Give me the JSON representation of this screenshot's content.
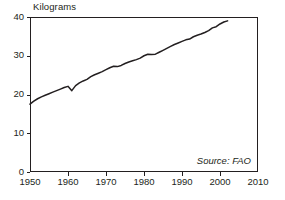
{
  "chart_data": {
    "type": "line",
    "title": "",
    "ylabel": "Kilograms",
    "xlabel": "",
    "xlim": [
      1950,
      2010
    ],
    "ylim": [
      0,
      40
    ],
    "grid": false,
    "legend": null,
    "annotations": [
      {
        "name": "source",
        "text": "Source: FAO",
        "position": "bottom-right-inside",
        "style": "italic"
      }
    ],
    "yticks": [
      0,
      10,
      20,
      30,
      40
    ],
    "ytick_labels": [
      "0",
      "10",
      "20",
      "30",
      "40"
    ],
    "xticks": [
      1950,
      1960,
      1970,
      1980,
      1990,
      2000,
      2010
    ],
    "xtick_labels": [
      "1950",
      "1960",
      "1970",
      "1980",
      "1990",
      "2000",
      "2010"
    ],
    "series": [
      {
        "name": "Kilograms per person",
        "color": "#231f20",
        "x": [
          1950,
          1951,
          1952,
          1953,
          1954,
          1955,
          1956,
          1957,
          1958,
          1959,
          1960,
          1961,
          1962,
          1963,
          1964,
          1965,
          1966,
          1967,
          1968,
          1969,
          1970,
          1971,
          1972,
          1973,
          1974,
          1975,
          1976,
          1977,
          1978,
          1979,
          1980,
          1981,
          1982,
          1983,
          1984,
          1985,
          1986,
          1987,
          1988,
          1989,
          1990,
          1991,
          1992,
          1993,
          1994,
          1995,
          1996,
          1997,
          1998,
          1999,
          2000,
          2001,
          2002
        ],
        "values": [
          17.5,
          18.3,
          18.9,
          19.4,
          19.8,
          20.2,
          20.6,
          21.0,
          21.4,
          21.8,
          22.1,
          21.0,
          22.3,
          23.0,
          23.5,
          23.9,
          24.6,
          25.1,
          25.5,
          25.9,
          26.4,
          26.9,
          27.3,
          27.2,
          27.5,
          28.0,
          28.4,
          28.7,
          29.0,
          29.4,
          30.0,
          30.4,
          30.3,
          30.4,
          30.9,
          31.4,
          31.9,
          32.4,
          32.9,
          33.3,
          33.7,
          34.1,
          34.3,
          34.9,
          35.3,
          35.6,
          36.0,
          36.5,
          37.2,
          37.5,
          38.2,
          38.7,
          39.0
        ]
      }
    ]
  }
}
